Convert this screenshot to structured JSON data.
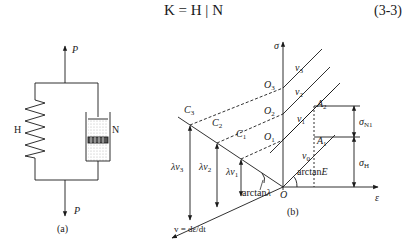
{
  "equation": {
    "text": "K = H | N",
    "number": "(3-3)"
  },
  "panel_a": {
    "caption": "(a)",
    "force_top": "P",
    "force_bottom": "P",
    "spring_label": "H",
    "dashpot_label": "N"
  },
  "panel_b": {
    "caption": "(b)",
    "axis_sigma": "σ",
    "axis_epsilon": "ε",
    "axis_v": "v = dε/dt",
    "origin": "O",
    "origin_points": [
      "O1",
      "O2",
      "O3"
    ],
    "c_points": [
      "C1",
      "C2",
      "C3"
    ],
    "a_points": [
      "A1",
      "A2"
    ],
    "lines": [
      "v0",
      "v1",
      "v2",
      "v3"
    ],
    "lambda_labels": [
      "λv1",
      "λv2",
      "λv3"
    ],
    "angle_E": "arctanE",
    "angle_lambda": "arctanλ",
    "sigma_N1": "σN1",
    "sigma_H": "σH"
  }
}
